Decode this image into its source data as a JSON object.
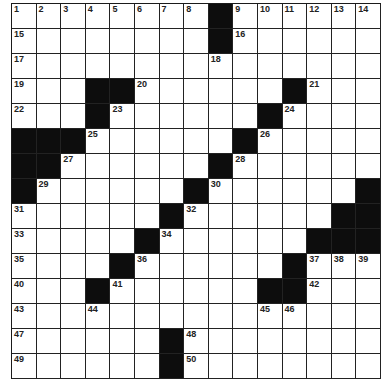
{
  "puzzle": {
    "columns": 15,
    "rows_visible": 15,
    "colors": {
      "black": "#0d0d0d",
      "white": "#ffffff",
      "line": "#222222"
    },
    "grid": [
      [
        "1",
        "2",
        "3",
        "4",
        "5",
        "6",
        "7",
        "8",
        "#",
        "9",
        "10",
        "11",
        "12",
        "13",
        "14"
      ],
      [
        "15",
        "",
        "",
        "",
        "",
        "",
        "",
        "",
        "#",
        "16",
        "",
        "",
        "",
        "",
        ""
      ],
      [
        "17",
        "",
        "",
        "",
        "",
        "",
        "",
        "",
        "18",
        "",
        "",
        "",
        "",
        "",
        ""
      ],
      [
        "19",
        "",
        "",
        "#",
        "#",
        "20",
        "",
        "",
        "",
        "",
        "",
        "#",
        "21",
        "",
        ""
      ],
      [
        "22",
        "",
        "",
        "#",
        "23",
        "",
        "",
        "",
        "",
        "",
        "#",
        "24",
        "",
        "",
        ""
      ],
      [
        "#",
        "#",
        "#",
        "25",
        "",
        "",
        "",
        "",
        "",
        "#",
        "26",
        "",
        "",
        "",
        ""
      ],
      [
        "#",
        "#",
        "27",
        "",
        "",
        "",
        "",
        "",
        "#",
        "28",
        "",
        "",
        "",
        "",
        ""
      ],
      [
        "#",
        "29",
        "",
        "",
        "",
        "",
        "",
        "#",
        "30",
        "",
        "",
        "",
        "",
        "",
        "#"
      ],
      [
        "31",
        "",
        "",
        "",
        "",
        "",
        "#",
        "32",
        "",
        "",
        "",
        "",
        "",
        "#",
        "#"
      ],
      [
        "33",
        "",
        "",
        "",
        "",
        "#",
        "34",
        "",
        "",
        "",
        "",
        "",
        "#",
        "#",
        "#"
      ],
      [
        "35",
        "",
        "",
        "",
        "#",
        "36",
        "",
        "",
        "",
        "",
        "",
        "#",
        "37",
        "38",
        "39"
      ],
      [
        "40",
        "",
        "",
        "#",
        "41",
        "",
        "",
        "",
        "",
        "",
        "#",
        "#",
        "42",
        "",
        ""
      ],
      [
        "43",
        "",
        "",
        "44",
        "",
        "",
        "",
        "",
        "",
        "",
        "45",
        "46",
        "",
        "",
        ""
      ],
      [
        "47",
        "",
        "",
        "",
        "",
        "",
        "#",
        "48",
        "",
        "",
        "",
        "",
        "",
        "",
        ""
      ],
      [
        "49",
        "",
        "",
        "",
        "",
        "",
        "#",
        "50",
        "",
        "",
        "",
        "",
        "",
        "",
        ""
      ]
    ]
  }
}
